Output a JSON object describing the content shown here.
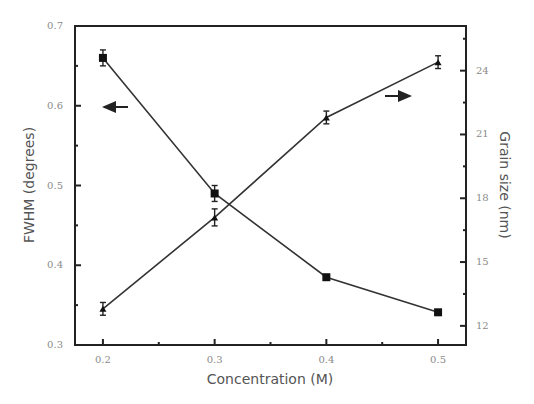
{
  "chart_data": {
    "type": "line",
    "title": "",
    "xlabel": "Concentration (M)",
    "ylabel_left": "FWHM (degrees)",
    "ylabel_right": "Grain size (nm)",
    "x": [
      0.2,
      0.3,
      0.4,
      0.5
    ],
    "xlim": [
      0.175,
      0.525
    ],
    "x_ticks": [
      0.2,
      0.3,
      0.4,
      0.5
    ],
    "x_tick_labels": [
      "0.2",
      "0.3",
      "0.4",
      "0.5"
    ],
    "ylim_left": [
      0.3,
      0.7
    ],
    "y_ticks_left": [
      0.3,
      0.4,
      0.5,
      0.6,
      0.7
    ],
    "y_tick_labels_left": [
      "0.3",
      "0.4",
      "0.5",
      "0.6",
      "0.7"
    ],
    "ylim_right": [
      11.1,
      26.1
    ],
    "y_ticks_right": [
      12,
      15,
      18,
      21,
      24
    ],
    "y_tick_labels_right": [
      "12",
      "15",
      "18",
      "21",
      "24"
    ],
    "grid": false,
    "series": [
      {
        "name": "FWHM",
        "axis": "left",
        "marker": "square",
        "values": [
          0.66,
          0.49,
          0.385,
          0.341
        ],
        "errors": [
          0.01,
          0.01,
          0.003,
          0.003
        ]
      },
      {
        "name": "Grain size",
        "axis": "right",
        "marker": "triangle",
        "values": [
          12.8,
          17.1,
          21.8,
          24.4
        ],
        "errors": [
          0.3,
          0.4,
          0.3,
          0.3
        ]
      }
    ],
    "annotations": [
      {
        "type": "arrow",
        "direction": "left",
        "points_to": "left axis",
        "near_series": "FWHM"
      },
      {
        "type": "arrow",
        "direction": "right",
        "points_to": "right axis",
        "near_series": "Grain size"
      }
    ]
  }
}
